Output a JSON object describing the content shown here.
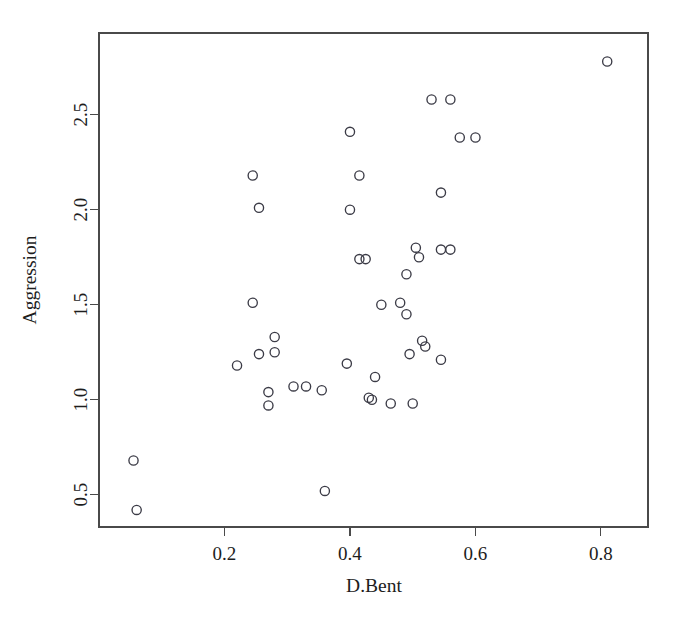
{
  "chart_data": {
    "type": "scatter",
    "title": "",
    "xlabel": "D.Bent",
    "ylabel": "Aggression",
    "xlim": [
      0.0,
      0.875
    ],
    "ylim": [
      0.33,
      2.93
    ],
    "grid": false,
    "legend": "none",
    "marker": "open-circle",
    "x_ticks": [
      0.2,
      0.4,
      0.6,
      0.8
    ],
    "x_tick_labels": [
      "0.2",
      "0.4",
      "0.6",
      "0.8"
    ],
    "y_ticks": [
      0.5,
      1.0,
      1.5,
      2.0,
      2.5
    ],
    "y_tick_labels": [
      "0.5",
      "1.0",
      "1.5",
      "2.0",
      "2.5"
    ],
    "point_color": "#3b3b46",
    "axis_color": "#4a4a4a",
    "background": "#ffffff",
    "n_points": 44,
    "points": [
      {
        "x": 0.055,
        "y": 0.68
      },
      {
        "x": 0.06,
        "y": 0.42
      },
      {
        "x": 0.22,
        "y": 1.18
      },
      {
        "x": 0.245,
        "y": 2.18
      },
      {
        "x": 0.245,
        "y": 1.51
      },
      {
        "x": 0.255,
        "y": 2.01
      },
      {
        "x": 0.255,
        "y": 1.24
      },
      {
        "x": 0.28,
        "y": 1.33
      },
      {
        "x": 0.28,
        "y": 1.25
      },
      {
        "x": 0.27,
        "y": 1.04
      },
      {
        "x": 0.27,
        "y": 0.97
      },
      {
        "x": 0.31,
        "y": 1.07
      },
      {
        "x": 0.33,
        "y": 1.07
      },
      {
        "x": 0.355,
        "y": 1.05
      },
      {
        "x": 0.36,
        "y": 0.52
      },
      {
        "x": 0.395,
        "y": 1.19
      },
      {
        "x": 0.4,
        "y": 2.41
      },
      {
        "x": 0.4,
        "y": 2.0
      },
      {
        "x": 0.415,
        "y": 2.18
      },
      {
        "x": 0.415,
        "y": 1.74
      },
      {
        "x": 0.43,
        "y": 1.01
      },
      {
        "x": 0.44,
        "y": 1.12
      },
      {
        "x": 0.435,
        "y": 1.0
      },
      {
        "x": 0.45,
        "y": 1.5
      },
      {
        "x": 0.465,
        "y": 0.98
      },
      {
        "x": 0.49,
        "y": 1.45
      },
      {
        "x": 0.49,
        "y": 1.66
      },
      {
        "x": 0.495,
        "y": 1.24
      },
      {
        "x": 0.5,
        "y": 0.98
      },
      {
        "x": 0.505,
        "y": 1.8
      },
      {
        "x": 0.51,
        "y": 1.75
      },
      {
        "x": 0.515,
        "y": 1.31
      },
      {
        "x": 0.53,
        "y": 2.58
      },
      {
        "x": 0.545,
        "y": 2.09
      },
      {
        "x": 0.545,
        "y": 1.79
      },
      {
        "x": 0.545,
        "y": 1.21
      },
      {
        "x": 0.575,
        "y": 2.38
      },
      {
        "x": 0.6,
        "y": 2.38
      },
      {
        "x": 0.81,
        "y": 2.78
      },
      {
        "x": 0.425,
        "y": 1.74
      },
      {
        "x": 0.52,
        "y": 1.28
      },
      {
        "x": 0.56,
        "y": 1.79
      },
      {
        "x": 0.48,
        "y": 1.51
      },
      {
        "x": 0.56,
        "y": 2.58
      }
    ]
  },
  "axes": {
    "x_title": "D.Bent",
    "y_title": "Aggression"
  }
}
